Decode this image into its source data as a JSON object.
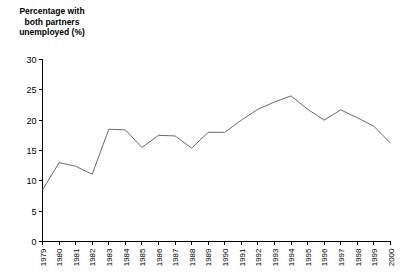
{
  "chart_data": {
    "type": "line",
    "title": "Percentage with\nboth partners\nunemployed (%)",
    "xlabel": "",
    "ylabel": "Percentage with both partners unemployed (%)",
    "ylim": [
      0,
      30
    ],
    "yticks": [
      0,
      5,
      10,
      15,
      20,
      25,
      30
    ],
    "grid": false,
    "legend": "none",
    "line_color": "#6a6a6a",
    "categories": [
      "1979",
      "1980",
      "1981",
      "1982",
      "1983",
      "1984",
      "1985",
      "1986",
      "1987",
      "1988",
      "1989",
      "1990",
      "1991",
      "1992",
      "1993",
      "1994",
      "1995",
      "1996",
      "1997",
      "1998",
      "1999",
      "2000"
    ],
    "values": [
      8.5,
      13.0,
      12.4,
      11.1,
      18.5,
      18.4,
      15.5,
      17.5,
      17.4,
      15.4,
      18.0,
      18.0,
      20.0,
      21.8,
      23.0,
      24.0,
      21.8,
      20.0,
      21.7,
      20.4,
      19.0,
      16.2
    ]
  }
}
